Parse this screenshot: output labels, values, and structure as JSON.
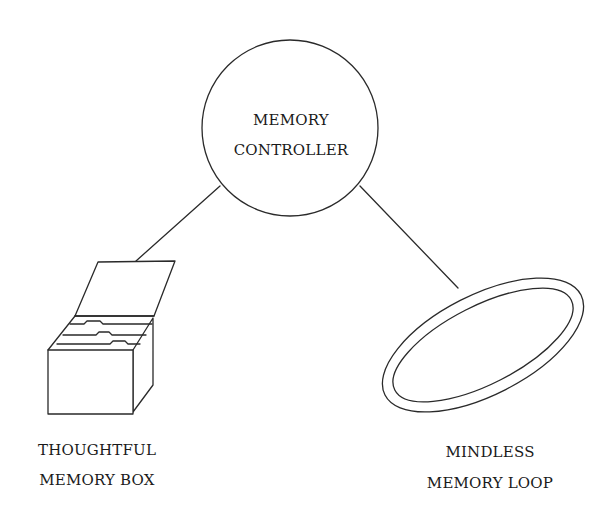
{
  "diagram": {
    "nodes": [
      {
        "id": "controller",
        "shape": "circle",
        "label_lines": [
          "MEMORY",
          "CONTROLLER"
        ]
      },
      {
        "id": "box",
        "shape": "file-box",
        "label_lines": [
          "THOUGHTFUL",
          "MEMORY BOX"
        ]
      },
      {
        "id": "loop",
        "shape": "double-ellipse-ring",
        "label_lines": [
          "MINDLESS",
          "MEMORY LOOP"
        ]
      }
    ],
    "edges": [
      {
        "from": "controller",
        "to": "box"
      },
      {
        "from": "controller",
        "to": "loop"
      }
    ]
  },
  "colors": {
    "background": "#ffffff",
    "line": "#2a2a2a",
    "text": "#1a1a1a"
  }
}
